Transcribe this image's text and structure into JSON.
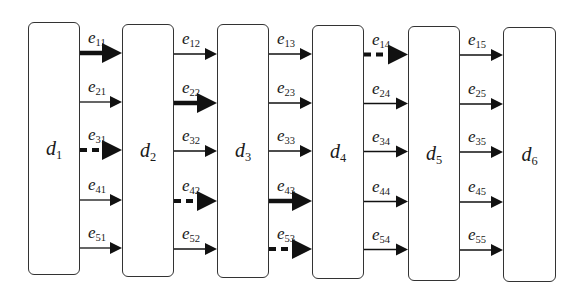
{
  "diagram": {
    "type": "layered-flow",
    "nodes": [
      {
        "id": "d1",
        "base": "d",
        "sub": "1",
        "x": 28,
        "y": 22,
        "w": 52,
        "h": 253
      },
      {
        "id": "d2",
        "base": "d",
        "sub": "2",
        "x": 122,
        "y": 24,
        "w": 52,
        "h": 253
      },
      {
        "id": "d3",
        "base": "d",
        "sub": "3",
        "x": 217,
        "y": 24,
        "w": 52,
        "h": 254
      },
      {
        "id": "d4",
        "base": "d",
        "sub": "4",
        "x": 312,
        "y": 25,
        "w": 52,
        "h": 254
      },
      {
        "id": "d5",
        "base": "d",
        "sub": "5",
        "x": 408,
        "y": 26,
        "w": 52,
        "h": 255
      },
      {
        "id": "d6",
        "base": "d",
        "sub": "6",
        "x": 503,
        "y": 27,
        "w": 53,
        "h": 255
      }
    ],
    "row_y": [
      53,
      102,
      150,
      200,
      248
    ],
    "edge_styles": {
      "thin": {
        "stroke_width": 1.3,
        "dash": "",
        "head": "small"
      },
      "bold": {
        "stroke_width": 4.5,
        "dash": "",
        "head": "large"
      },
      "dashed": {
        "stroke_width": 4,
        "dash": "7 5",
        "head": "large"
      }
    },
    "edges": [
      {
        "label_base": "e",
        "label_sub": "11",
        "from": "d1",
        "to": "d2",
        "row": 0,
        "style": "bold"
      },
      {
        "label_base": "e",
        "label_sub": "21",
        "from": "d1",
        "to": "d2",
        "row": 1,
        "style": "thin"
      },
      {
        "label_base": "e",
        "label_sub": "31",
        "from": "d1",
        "to": "d2",
        "row": 2,
        "style": "dashed"
      },
      {
        "label_base": "e",
        "label_sub": "41",
        "from": "d1",
        "to": "d2",
        "row": 3,
        "style": "thin"
      },
      {
        "label_base": "e",
        "label_sub": "51",
        "from": "d1",
        "to": "d2",
        "row": 4,
        "style": "thin"
      },
      {
        "label_base": "e",
        "label_sub": "12",
        "from": "d2",
        "to": "d3",
        "row": 0,
        "style": "thin"
      },
      {
        "label_base": "e",
        "label_sub": "22",
        "from": "d2",
        "to": "d3",
        "row": 1,
        "style": "bold"
      },
      {
        "label_base": "e",
        "label_sub": "32",
        "from": "d2",
        "to": "d3",
        "row": 2,
        "style": "thin"
      },
      {
        "label_base": "e",
        "label_sub": "42",
        "from": "d2",
        "to": "d3",
        "row": 3,
        "style": "dashed"
      },
      {
        "label_base": "e",
        "label_sub": "52",
        "from": "d2",
        "to": "d3",
        "row": 4,
        "style": "thin"
      },
      {
        "label_base": "e",
        "label_sub": "13",
        "from": "d3",
        "to": "d4",
        "row": 0,
        "style": "thin"
      },
      {
        "label_base": "e",
        "label_sub": "23",
        "from": "d3",
        "to": "d4",
        "row": 1,
        "style": "thin"
      },
      {
        "label_base": "e",
        "label_sub": "33",
        "from": "d3",
        "to": "d4",
        "row": 2,
        "style": "thin"
      },
      {
        "label_base": "e",
        "label_sub": "43",
        "from": "d3",
        "to": "d4",
        "row": 3,
        "style": "bold"
      },
      {
        "label_base": "e",
        "label_sub": "53",
        "from": "d3",
        "to": "d4",
        "row": 4,
        "style": "dashed"
      },
      {
        "label_base": "e",
        "label_sub": "14",
        "from": "d4",
        "to": "d5",
        "row": 0,
        "style": "dashed"
      },
      {
        "label_base": "e",
        "label_sub": "24",
        "from": "d4",
        "to": "d5",
        "row": 1,
        "style": "thin"
      },
      {
        "label_base": "e",
        "label_sub": "34",
        "from": "d4",
        "to": "d5",
        "row": 2,
        "style": "thin"
      },
      {
        "label_base": "e",
        "label_sub": "44",
        "from": "d4",
        "to": "d5",
        "row": 3,
        "style": "thin"
      },
      {
        "label_base": "e",
        "label_sub": "54",
        "from": "d4",
        "to": "d5",
        "row": 4,
        "style": "thin"
      },
      {
        "label_base": "e",
        "label_sub": "15",
        "from": "d5",
        "to": "d6",
        "row": 0,
        "style": "thin"
      },
      {
        "label_base": "e",
        "label_sub": "25",
        "from": "d5",
        "to": "d6",
        "row": 1,
        "style": "thin"
      },
      {
        "label_base": "e",
        "label_sub": "35",
        "from": "d5",
        "to": "d6",
        "row": 2,
        "style": "thin"
      },
      {
        "label_base": "e",
        "label_sub": "45",
        "from": "d5",
        "to": "d6",
        "row": 3,
        "style": "thin"
      },
      {
        "label_base": "e",
        "label_sub": "55",
        "from": "d5",
        "to": "d6",
        "row": 4,
        "style": "thin"
      }
    ],
    "colors": {
      "stroke": "#111111",
      "box_border": "#333333",
      "background": "#ffffff"
    }
  }
}
